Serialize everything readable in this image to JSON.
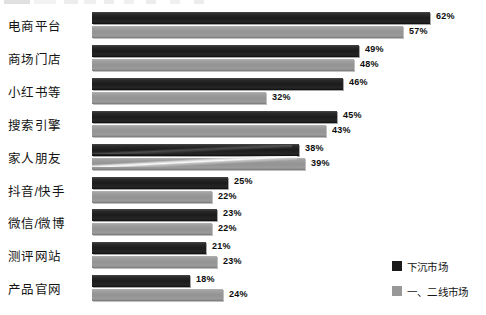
{
  "chart_data": {
    "type": "bar",
    "orientation": "horizontal",
    "title": "",
    "xlabel": "",
    "ylabel": "",
    "xlim": [
      0,
      62
    ],
    "grid": false,
    "legend_position": "bottom-right",
    "value_suffix": "%",
    "categories": [
      "电商平台",
      "商场门店",
      "小红书等",
      "搜索引擎",
      "家人朋友",
      "抖音/快手",
      "微信/微博",
      "测评网站",
      "产品官网"
    ],
    "series": [
      {
        "name": "下沉市场",
        "color": "#1b1b1b",
        "values": [
          62,
          49,
          46,
          45,
          38,
          25,
          23,
          21,
          18
        ],
        "labels": [
          "62%",
          "49%",
          "46%",
          "45%",
          "38%",
          "25%",
          "23%",
          "21%",
          "18%"
        ]
      },
      {
        "name": "一、二线市场",
        "color": "#989898",
        "values": [
          57,
          48,
          32,
          43,
          39,
          22,
          22,
          23,
          24
        ],
        "labels": [
          "57%",
          "48%",
          "32%",
          "43%",
          "39%",
          "22%",
          "22%",
          "23%",
          "24%"
        ]
      }
    ]
  },
  "legend": {
    "items": [
      {
        "label": "下沉市场",
        "color": "#1b1b1b"
      },
      {
        "label": "一、二线市场",
        "color": "#989898"
      }
    ]
  }
}
